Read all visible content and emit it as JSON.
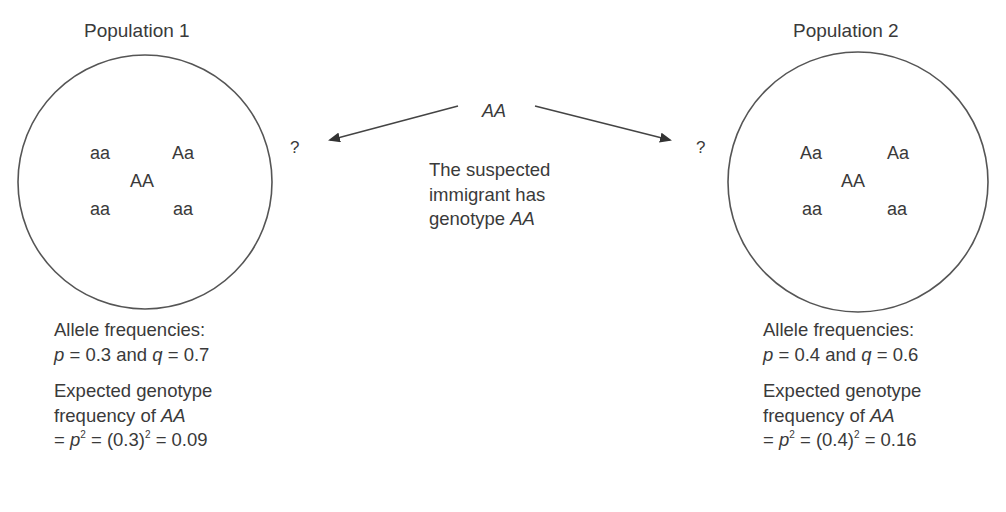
{
  "population1": {
    "title": "Population 1",
    "genotypes": [
      "aa",
      "Aa",
      "AA",
      "aa",
      "aa"
    ],
    "allele_label": "Allele frequencies:",
    "p_sym": "p",
    "p_val": "= 0.3 and ",
    "q_sym": "q",
    "q_val": "= 0.7",
    "expected_label": "Expected genotype",
    "expected_label2": "frequency of ",
    "expected_geno": "AA",
    "formula_pre": "= ",
    "formula_p": "p",
    "formula_mid": " = (0.3)",
    "formula_end": " = 0.09",
    "exp": "2"
  },
  "population2": {
    "title": "Population 2",
    "genotypes": [
      "Aa",
      "Aa",
      "AA",
      "aa",
      "aa"
    ],
    "allele_label": "Allele frequencies:",
    "p_sym": "p",
    "p_val": "= 0.4 and ",
    "q_sym": "q",
    "q_val": "= 0.6",
    "expected_label": "Expected genotype",
    "expected_label2": "frequency of ",
    "expected_geno": "AA",
    "formula_pre": "= ",
    "formula_p": "p",
    "formula_mid": " = (0.4)",
    "formula_end": " = 0.16",
    "exp": "2"
  },
  "immigrant": {
    "genotype": "AA",
    "caption_line1": "The suspected",
    "caption_line2": "immigrant has",
    "caption_line3_pre": "genotype ",
    "caption_line3_geno": "AA"
  },
  "question_mark": "?",
  "colors": {
    "text": "#3a3a3a",
    "line": "#444444"
  }
}
